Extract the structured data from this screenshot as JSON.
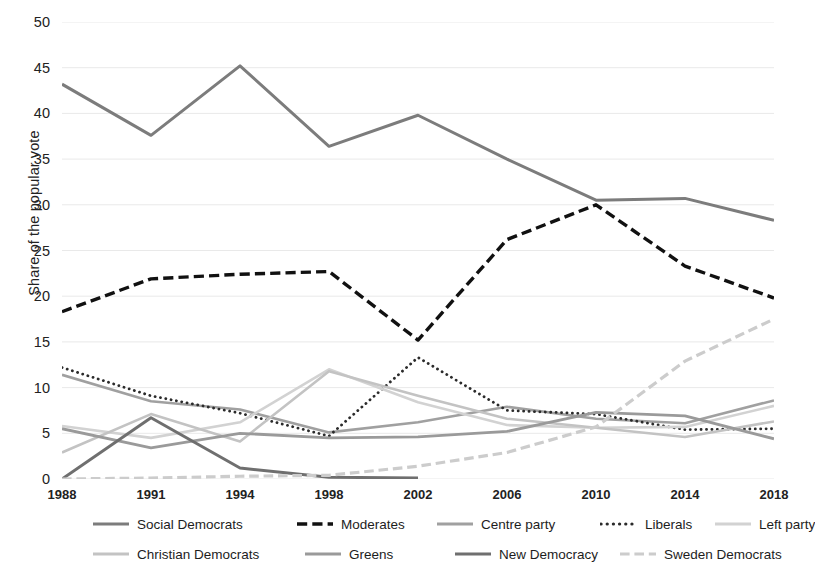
{
  "chart_data": {
    "type": "line",
    "title": "",
    "xlabel": "",
    "ylabel": "Share of the popular vote",
    "x": [
      1988,
      1991,
      1994,
      1998,
      2002,
      2006,
      2010,
      2014,
      2018
    ],
    "xticklabels": [
      "1988",
      "1991",
      "1994",
      "1998",
      "2002",
      "2006",
      "2010",
      "2014",
      "2018"
    ],
    "ylim": [
      0,
      50
    ],
    "yticks": [
      0,
      5,
      10,
      15,
      20,
      25,
      30,
      35,
      40,
      45,
      50
    ],
    "yticklabels": [
      "0",
      "5",
      "10",
      "15",
      "20",
      "25",
      "30",
      "35",
      "40",
      "45",
      "50"
    ],
    "grid": "horizontal",
    "legend_position": "bottom",
    "series": [
      {
        "name": "Social Democrats",
        "color": "#7c7c7c",
        "width": 3.0,
        "dash": "none",
        "values": [
          43.2,
          37.6,
          45.2,
          36.4,
          39.8,
          35.0,
          30.5,
          30.7,
          28.3
        ]
      },
      {
        "name": "Moderates",
        "color": "#111111",
        "width": 3.4,
        "dash": "dashed",
        "values": [
          18.3,
          21.9,
          22.4,
          22.7,
          15.2,
          26.2,
          30.0,
          23.3,
          19.8
        ]
      },
      {
        "name": "Centre party",
        "color": "#a0a0a0",
        "width": 2.6,
        "dash": "none",
        "values": [
          11.4,
          8.5,
          7.6,
          5.1,
          6.2,
          7.9,
          6.6,
          6.1,
          8.6
        ]
      },
      {
        "name": "Liberals",
        "color": "#2b2b2b",
        "width": 2.8,
        "dash": "dotted",
        "values": [
          12.2,
          9.1,
          7.2,
          4.7,
          13.3,
          7.5,
          7.1,
          5.4,
          5.5
        ]
      },
      {
        "name": "Left party",
        "color": "#d2d2d2",
        "width": 2.6,
        "dash": "none",
        "values": [
          5.8,
          4.5,
          6.2,
          12.0,
          8.4,
          5.9,
          5.6,
          5.7,
          8.0
        ]
      },
      {
        "name": "Christian Democrats",
        "color": "#c3c3c3",
        "width": 2.6,
        "dash": "none",
        "values": [
          2.9,
          7.1,
          4.1,
          11.8,
          9.1,
          6.6,
          5.6,
          4.6,
          6.3
        ]
      },
      {
        "name": "Greens",
        "color": "#9a9a9a",
        "width": 2.8,
        "dash": "none",
        "values": [
          5.5,
          3.4,
          5.0,
          4.5,
          4.6,
          5.2,
          7.3,
          6.9,
          4.4
        ]
      },
      {
        "name": "New Democracy",
        "color": "#6f6f6f",
        "width": 3.0,
        "dash": "none",
        "values": [
          0.0,
          6.7,
          1.2,
          0.2,
          0.1,
          null,
          null,
          null,
          null
        ]
      },
      {
        "name": "Sweden Democrats",
        "color": "#cccccc",
        "width": 3.2,
        "dash": "dashed",
        "values": [
          0.0,
          0.1,
          0.3,
          0.4,
          1.4,
          2.9,
          5.7,
          12.9,
          17.5
        ]
      }
    ]
  },
  "legend": {
    "rows": [
      [
        {
          "label": "Social Democrats",
          "series": 0
        },
        {
          "label": "Moderates",
          "series": 1
        },
        {
          "label": "Centre party",
          "series": 2
        },
        {
          "label": "Liberals",
          "series": 3
        },
        {
          "label": "Left party",
          "series": 4
        }
      ],
      [
        {
          "label": "Christian Democrats",
          "series": 5
        },
        {
          "label": "Greens",
          "series": 6
        },
        {
          "label": "New Democracy",
          "series": 7
        },
        {
          "label": "Sweden Democrats",
          "series": 8
        }
      ]
    ]
  }
}
